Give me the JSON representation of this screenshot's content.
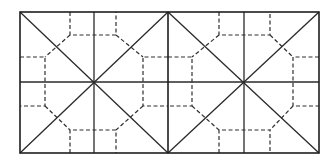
{
  "diagram": {
    "type": "fold-pattern",
    "colors": {
      "background": "#ffffff",
      "line": "#2a2a2a"
    },
    "frame": {
      "x1": 20,
      "y1": 12,
      "x2": 319,
      "y2": 153
    },
    "squares": [
      {
        "id": "left",
        "x1": 20,
        "x2": 168,
        "y1": 12,
        "y2": 153,
        "center": [
          94,
          82
        ],
        "octagon": {
          "left": 45,
          "right": 143,
          "top": 35,
          "bottom": 130,
          "inner_x": [
            70,
            116
          ],
          "inner_y": [
            57,
            106
          ]
        }
      },
      {
        "id": "right",
        "x1": 168,
        "x2": 319,
        "y1": 12,
        "y2": 153,
        "center": [
          244,
          82
        ],
        "octagon": {
          "left": 192,
          "right": 293,
          "top": 35,
          "bottom": 130,
          "inner_x": [
            219,
            270
          ],
          "inner_y": [
            57,
            106
          ]
        }
      }
    ]
  }
}
